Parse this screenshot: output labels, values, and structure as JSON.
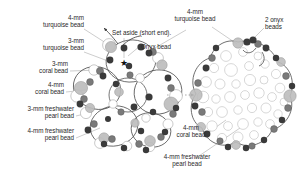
{
  "figure": {
    "type": "beadwork-instruction-diagram",
    "background_color": "#ffffff",
    "panels": [
      {
        "name": "left-bead-cluster",
        "role": "open-loop-layout"
      },
      {
        "name": "right-bead-cluster",
        "role": "completed-dense-layout"
      }
    ],
    "flow_arrow": "dotted-right-arrow"
  },
  "labels": {
    "turquoise_4mm": "4-mm\nturquoise bead",
    "turquoise_3mm": "3-mm\nturquoise bead",
    "coral_3mm": "3-mm\ncoral bead",
    "coral_4mm": "4-mm\ncoral bead",
    "pearl_3mm": "3-mm freshwater\npearl bead",
    "pearl_4mm": "4-mm freshwater\npearl bead",
    "set_aside": "Set aside (short end).",
    "onyx_bead": "Onyx bead",
    "turquoise_4mm_right": "4-mm\nturquoise bead",
    "onyx_2_right": "2 onyx\nbeads",
    "coral_4mm_right": "4-mm\ncoral bead",
    "pearl_4mm_right": "4-mm freshwater\npearl bead"
  },
  "colors": {
    "onyx": "#3a3a3a",
    "coral": "#6e6e6e",
    "turquoise": "#b9b9b9",
    "pearl": "#ffffff",
    "thread": "#4a4a4a",
    "leader": "#9a9a9a",
    "text": "#2a2a2a"
  },
  "markers": {
    "star": "★",
    "star_meaning": "starting-point-marker"
  },
  "bead_counts": {
    "onyx_group": 2
  }
}
